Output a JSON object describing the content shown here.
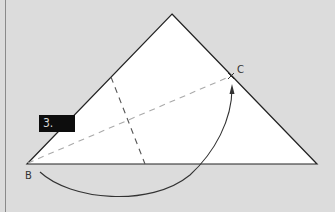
{
  "diagram": {
    "step_number": "3.",
    "points": {
      "b_label": "B",
      "c_label": "C"
    },
    "colors": {
      "background": "#dcdcdc",
      "paper": "#ffffff",
      "outline": "#222222",
      "valley_fold": "#555555",
      "reference_fold": "#aaaaaa",
      "arrow": "#333333",
      "label_bg": "#0d0d0d",
      "label_text": "#d8d8d8"
    }
  }
}
